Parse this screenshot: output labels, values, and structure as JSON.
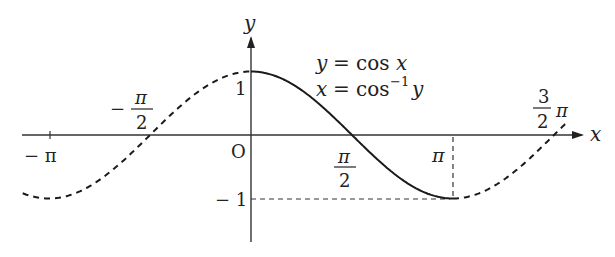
{
  "chart_data": {
    "type": "line",
    "title": "",
    "xlabel": "x",
    "ylabel": "y",
    "origin_label": "O",
    "xlim": [
      -3.3,
      3.9
    ],
    "ylim": [
      -1.6,
      1.8
    ],
    "grid": false,
    "legend": null,
    "annotations": [
      "y = cos x",
      "x = cos⁻¹ y"
    ],
    "x_ticks": [
      {
        "value": -3.14159,
        "label": "− π"
      },
      {
        "value": -1.5708,
        "label": "− π/2"
      },
      {
        "value": 1.5708,
        "label": "π/2"
      },
      {
        "value": 3.14159,
        "label": "π"
      },
      {
        "value": 4.71239,
        "label": "3/2 π"
      }
    ],
    "y_ticks": [
      {
        "value": 1,
        "label": "1"
      },
      {
        "value": -1,
        "label": "− 1"
      }
    ],
    "series": [
      {
        "name": "cos x (principal branch, solid)",
        "style": "solid",
        "domain": [
          0,
          3.14159
        ],
        "x": [
          0,
          0.785,
          1.571,
          2.356,
          3.142
        ],
        "values": [
          1,
          0.707,
          0,
          -0.707,
          -1
        ]
      },
      {
        "name": "cos x (extension, dashed)",
        "style": "dashed",
        "domain": [
          -3.14159,
          0
        ],
        "x": [
          -3.142,
          -2.356,
          -1.571,
          -0.785,
          0
        ],
        "values": [
          -1,
          -0.707,
          0,
          0.707,
          1
        ]
      },
      {
        "name": "cos x (extension, dashed)",
        "style": "dashed",
        "domain": [
          3.14159,
          4.9
        ],
        "x": [
          3.142,
          3.927,
          4.712
        ],
        "values": [
          -1,
          -0.707,
          0
        ]
      }
    ],
    "guides": [
      {
        "type": "vertical-dashed",
        "x": 3.14159,
        "from": 0,
        "to": -1
      },
      {
        "type": "horizontal-dashed",
        "y": -1,
        "from": 0,
        "to": 3.14159
      }
    ]
  },
  "labels": {
    "y_axis": "y",
    "x_axis": "x",
    "origin": "O",
    "one": "1",
    "minus_one": "− 1",
    "minus_pi": "− π",
    "minus_half_pi_sign": "−",
    "pi": "π",
    "frac_num_pi": "π",
    "frac_den_2": "2",
    "three": "3",
    "eq1_lhs": "y",
    "eq1_rhs": "= cos",
    "eq1_var": "x",
    "eq2_lhs": "x",
    "eq2_rhs": "= cos",
    "eq2_sup": "−1",
    "eq2_var": "y"
  }
}
